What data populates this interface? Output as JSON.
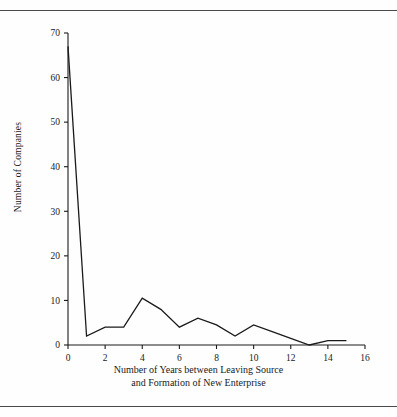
{
  "figure": {
    "clipped_header": "· ·",
    "y_axis_title": "Number of Companies",
    "x_axis_title_line1": "Number of Years between Leaving Source",
    "x_axis_title_line2": "and Formation of New Enterprise"
  },
  "chart_data": {
    "type": "line",
    "title": "",
    "xlabel": "Number of Years between Leaving Source and Formation of New Enterprise",
    "ylabel": "Number of Companies",
    "x": [
      0,
      1,
      2,
      3,
      4,
      5,
      6,
      7,
      8,
      9,
      10,
      11,
      12,
      13,
      14,
      15
    ],
    "values": [
      67,
      2,
      4,
      4,
      10.5,
      8,
      4,
      6,
      4.5,
      2,
      4.5,
      3,
      1.5,
      0,
      1,
      1
    ],
    "xlim": [
      0,
      16
    ],
    "ylim": [
      0,
      70
    ],
    "xticks": [
      0,
      2,
      4,
      6,
      8,
      10,
      12,
      14,
      16
    ],
    "yticks": [
      0,
      10,
      20,
      30,
      40,
      50,
      60,
      70
    ],
    "xtick_labels": [
      "0",
      "2",
      "4",
      "6",
      "8",
      "10",
      "12",
      "14",
      "16"
    ],
    "ytick_labels": [
      "0",
      "10",
      "20",
      "30",
      "40",
      "50",
      "60",
      "70"
    ],
    "grid": false,
    "legend": null,
    "line_color": "#1a1a1a",
    "series": [
      {
        "name": "Number of Companies",
        "values": [
          67,
          2,
          4,
          4,
          10.5,
          8,
          4,
          6,
          4.5,
          2,
          4.5,
          3,
          1.5,
          0,
          1,
          1
        ]
      }
    ]
  }
}
